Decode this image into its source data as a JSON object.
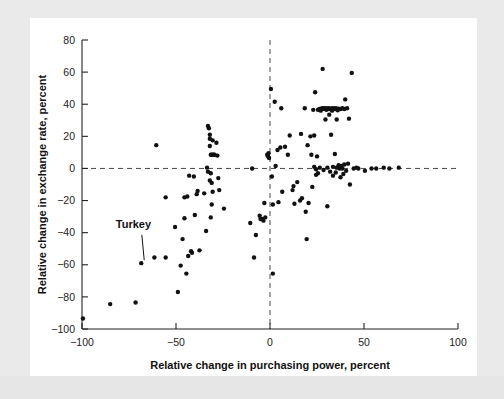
{
  "figure": {
    "background_color": "#ffffff",
    "page_color": "#ececeb"
  },
  "annotations": [
    {
      "name": "turkey-label",
      "text": "Turkey",
      "label_x": -82,
      "label_y": -37,
      "point_x": -68.5,
      "point_y": -59.0
    }
  ],
  "chart_data": {
    "type": "scatter",
    "title": "",
    "xlabel": "Relative change in purchasing power, percent",
    "ylabel": "Relative change in exchange rate, percent",
    "xlim": [
      -100,
      100
    ],
    "ylim": [
      -100,
      80
    ],
    "xticks": [
      -100,
      -50,
      0,
      50,
      100
    ],
    "yticks": [
      -100,
      -80,
      -60,
      -40,
      -20,
      0,
      20,
      40,
      60,
      80
    ],
    "xticklabels": [
      "−100",
      "−50",
      "0",
      "50",
      "100"
    ],
    "yticklabels": [
      "−100",
      "−80",
      "−60",
      "−40",
      "−20",
      "0",
      "20",
      "40",
      "60",
      "80"
    ],
    "grid": false,
    "legend": "none",
    "reference_lines": [
      {
        "name": "zero-vertical",
        "axis": "x",
        "value": 0,
        "style": "dashed"
      },
      {
        "name": "zero-horizontal",
        "axis": "y",
        "value": 0,
        "style": "dashed"
      }
    ],
    "marker": {
      "shape": "circle",
      "size_px": 2.2,
      "color": "#111111"
    },
    "points": [
      [
        -99.5,
        -93.5
      ],
      [
        -85.0,
        -84.5
      ],
      [
        -71.5,
        -83.5
      ],
      [
        -68.5,
        -59.0
      ],
      [
        -61.5,
        -55.5
      ],
      [
        -55.5,
        -55.5
      ],
      [
        -60.5,
        14.5
      ],
      [
        -55.5,
        -18.0
      ],
      [
        -50.5,
        -36.5
      ],
      [
        -49.0,
        -77.0
      ],
      [
        -47.5,
        -60.5
      ],
      [
        -46.5,
        -44.0
      ],
      [
        -45.5,
        -31.0
      ],
      [
        -44.5,
        -65.5
      ],
      [
        -44.0,
        -17.5
      ],
      [
        -43.0,
        -4.5
      ],
      [
        -42.0,
        -51.5
      ],
      [
        -41.5,
        -52.5
      ],
      [
        -40.5,
        -5.0
      ],
      [
        -40.0,
        -29.0
      ],
      [
        -39.0,
        -16.0
      ],
      [
        -38.5,
        -14.0
      ],
      [
        -37.5,
        -51.0
      ],
      [
        -35.0,
        -15.5
      ],
      [
        -34.0,
        -39.0
      ],
      [
        -33.5,
        0.5
      ],
      [
        -33.0,
        26.5
      ],
      [
        -32.5,
        25.0
      ],
      [
        -32.0,
        18.5
      ],
      [
        -32.0,
        14.0
      ],
      [
        -32.0,
        21.0
      ],
      [
        -31.5,
        8.5
      ],
      [
        -31.0,
        8.5
      ],
      [
        -30.5,
        8.5
      ],
      [
        -30.0,
        8.5
      ],
      [
        -29.5,
        8.5
      ],
      [
        -31.5,
        -3.0
      ],
      [
        -31.0,
        -9.0
      ],
      [
        -30.5,
        -14.5
      ],
      [
        -31.0,
        -22.5
      ],
      [
        -31.5,
        -30.5
      ],
      [
        -30.5,
        17.5
      ],
      [
        -28.5,
        16.0
      ],
      [
        -28.0,
        8.0
      ],
      [
        -27.5,
        -6.0
      ],
      [
        -24.5,
        -25.0
      ],
      [
        -27.0,
        -13.5
      ],
      [
        -10.5,
        -34.0
      ],
      [
        -9.5,
        0.0
      ],
      [
        -8.5,
        -55.5
      ],
      [
        -7.5,
        -41.5
      ],
      [
        -5.5,
        -29.5
      ],
      [
        -5.0,
        -31.5
      ],
      [
        -4.0,
        -31.5
      ],
      [
        -3.5,
        -32.5
      ],
      [
        -3.0,
        -21.5
      ],
      [
        -1.5,
        8.5
      ],
      [
        -1.0,
        7.5
      ],
      [
        -0.8,
        9.5
      ],
      [
        -0.5,
        6.5
      ],
      [
        0.5,
        49.5
      ],
      [
        1.0,
        -5.0
      ],
      [
        1.5,
        -22.5
      ],
      [
        1.5,
        -65.5
      ],
      [
        2.5,
        41.5
      ],
      [
        3.0,
        1.5
      ],
      [
        4.0,
        11.5
      ],
      [
        4.5,
        -21.0
      ],
      [
        5.5,
        13.0
      ],
      [
        6.0,
        37.5
      ],
      [
        6.5,
        -14.5
      ],
      [
        8.0,
        13.5
      ],
      [
        9.5,
        8.5
      ],
      [
        10.5,
        20.5
      ],
      [
        12.0,
        -13.5
      ],
      [
        13.0,
        -22.0
      ],
      [
        14.5,
        -8.5
      ],
      [
        16.5,
        21.5
      ],
      [
        17.0,
        -18.5
      ],
      [
        18.5,
        37.5
      ],
      [
        19.0,
        -27.0
      ],
      [
        19.5,
        -44.0
      ],
      [
        20.0,
        14.5
      ],
      [
        20.5,
        -21.5
      ],
      [
        21.5,
        20.0
      ],
      [
        22.0,
        8.5
      ],
      [
        22.5,
        -11.5
      ],
      [
        23.0,
        36.5
      ],
      [
        23.5,
        20.5
      ],
      [
        23.5,
        1.0
      ],
      [
        24.0,
        47.5
      ],
      [
        24.5,
        -0.5
      ],
      [
        24.5,
        -4.0
      ],
      [
        25.0,
        7.5
      ],
      [
        25.5,
        36.5
      ],
      [
        26.0,
        36.8
      ],
      [
        26.5,
        37.0
      ],
      [
        27.0,
        37.2
      ],
      [
        27.5,
        37.0
      ],
      [
        28.0,
        37.5
      ],
      [
        28.0,
        62.0
      ],
      [
        28.5,
        37.2
      ],
      [
        29.0,
        37.5
      ],
      [
        29.5,
        30.5
      ],
      [
        29.5,
        37.0
      ],
      [
        30.0,
        37.4
      ],
      [
        30.5,
        37.0
      ],
      [
        30.5,
        -23.5
      ],
      [
        31.0,
        37.5
      ],
      [
        31.5,
        37.0
      ],
      [
        31.5,
        33.5
      ],
      [
        32.0,
        37.2
      ],
      [
        32.5,
        21.0
      ],
      [
        32.5,
        37.0
      ],
      [
        33.0,
        37.5
      ],
      [
        33.5,
        37.0
      ],
      [
        33.5,
        1.0
      ],
      [
        34.0,
        37.3
      ],
      [
        34.5,
        9.0
      ],
      [
        34.5,
        37.0
      ],
      [
        35.0,
        37.5
      ],
      [
        35.5,
        0.5
      ],
      [
        35.5,
        30.5
      ],
      [
        36.0,
        37.0
      ],
      [
        36.5,
        2.0
      ],
      [
        36.5,
        37.2
      ],
      [
        37.0,
        0.0
      ],
      [
        37.5,
        37.0
      ],
      [
        37.5,
        -5.5
      ],
      [
        38.0,
        1.5
      ],
      [
        38.5,
        37.5
      ],
      [
        38.5,
        0.0
      ],
      [
        39.0,
        -3.5
      ],
      [
        39.5,
        37.0
      ],
      [
        39.5,
        2.5
      ],
      [
        40.0,
        43.0
      ],
      [
        40.5,
        -1.5
      ],
      [
        41.0,
        37.5
      ],
      [
        41.5,
        3.0
      ],
      [
        42.0,
        31.0
      ],
      [
        42.5,
        -10.0
      ],
      [
        43.5,
        59.5
      ],
      [
        44.5,
        0.0
      ],
      [
        46.0,
        0.5
      ],
      [
        47.0,
        0.0
      ],
      [
        50.5,
        -1.5
      ],
      [
        54.0,
        0.0
      ],
      [
        56.5,
        0.0
      ],
      [
        60.5,
        0.5
      ],
      [
        63.5,
        0.0
      ],
      [
        68.5,
        0.5
      ],
      [
        -33.0,
        -2.0
      ],
      [
        -32.0,
        -7.5
      ],
      [
        27.0,
        36.0
      ],
      [
        30.0,
        36.5
      ],
      [
        33.0,
        36.0
      ],
      [
        36.0,
        36.2
      ],
      [
        -45.5,
        -18.0
      ],
      [
        -43.5,
        -54.5
      ],
      [
        16.0,
        -20.0
      ],
      [
        12.5,
        -11.0
      ],
      [
        -2.5,
        -30.5
      ],
      [
        25.5,
        -3.0
      ],
      [
        26.5,
        0.5
      ],
      [
        28.5,
        -1.0
      ],
      [
        30.5,
        0.5
      ],
      [
        32.0,
        -2.0
      ],
      [
        33.5,
        -4.5
      ],
      [
        35.0,
        -2.5
      ]
    ]
  }
}
